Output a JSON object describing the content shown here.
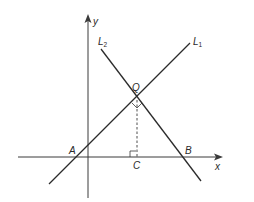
{
  "diagram": {
    "colors": {
      "line": "#2b2b2b",
      "axis": "#3a3a3a",
      "background": "#ffffff"
    },
    "axes": {
      "x_label": "x",
      "y_label": "y"
    },
    "lines": [
      {
        "id": "L1",
        "label": "L",
        "subscript": "1"
      },
      {
        "id": "L2",
        "label": "L",
        "subscript": "2"
      }
    ],
    "points": {
      "Q": "Q",
      "A": "A",
      "B": "B",
      "C": "C"
    },
    "annotations": {
      "perpendicular_QC": "dashed perpendicular from Q to C on x-axis",
      "right_angle_at_Q": "L1 ⊥ L2 at Q",
      "right_angle_at_C": "QC ⊥ x-axis at C"
    }
  }
}
